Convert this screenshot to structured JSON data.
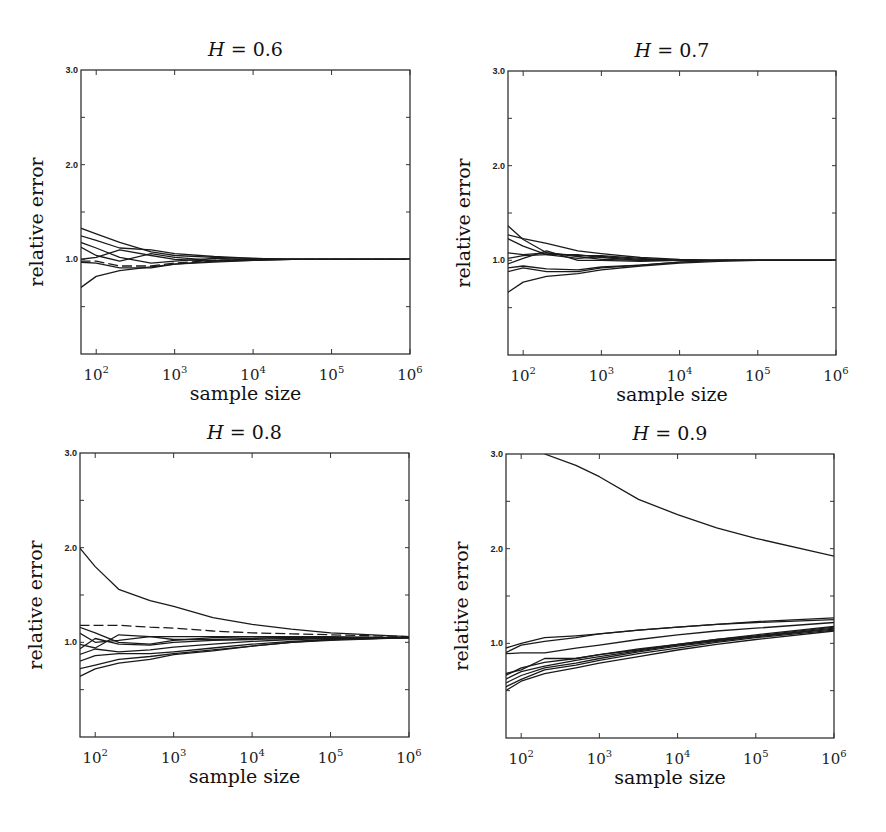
{
  "figure": {
    "x_label": "sample size",
    "y_label": "relative error",
    "y_tick_labels": [
      "3.0",
      "2.0",
      "1.0"
    ],
    "x_tick_labels": [
      {
        "base": "10",
        "exp": "2"
      },
      {
        "base": "10",
        "exp": "3"
      },
      {
        "base": "10",
        "exp": "4"
      },
      {
        "base": "10",
        "exp": "5"
      },
      {
        "base": "10",
        "exp": "6"
      }
    ],
    "line_color": "#1a1a1a"
  },
  "chart_data": [
    {
      "type": "line",
      "title": "H = 0.6",
      "title_var": "H",
      "title_value": "= 0.6",
      "xlabel": "sample size",
      "ylabel": "relative error",
      "xscale": "log",
      "xlim": [
        64,
        1000000
      ],
      "ylim": [
        0,
        3
      ],
      "yticks": [
        1.0,
        2.0,
        3.0
      ],
      "xticks": [
        100,
        1000,
        10000,
        100000,
        1000000
      ],
      "grid": false,
      "x_log10": [
        1.8,
        2.0,
        2.3,
        2.7,
        3.0,
        3.5,
        4.0,
        4.5,
        5.0,
        6.0
      ],
      "series": [
        {
          "name": "run 1",
          "values": [
            1.33,
            1.27,
            1.18,
            1.08,
            1.04,
            1.02,
            1.01,
            1.0,
            1.0,
            1.0
          ]
        },
        {
          "name": "run 2",
          "values": [
            1.25,
            1.2,
            1.12,
            1.1,
            1.06,
            1.03,
            1.01,
            1.0,
            1.0,
            1.0
          ]
        },
        {
          "name": "run 3",
          "values": [
            1.18,
            1.12,
            1.02,
            0.96,
            0.98,
            1.01,
            1.0,
            1.0,
            1.0,
            1.0
          ]
        },
        {
          "name": "run 4",
          "values": [
            1.13,
            1.04,
            0.98,
            1.06,
            1.02,
            0.99,
            1.0,
            1.0,
            1.0,
            1.0
          ]
        },
        {
          "name": "run 5",
          "values": [
            1.0,
            1.02,
            1.1,
            1.04,
            1.0,
            0.98,
            1.0,
            1.0,
            1.0,
            1.0
          ]
        },
        {
          "name": "run 6",
          "values": [
            0.98,
            0.98,
            0.93,
            0.93,
            0.96,
            0.99,
            1.0,
            1.0,
            1.0,
            1.0
          ],
          "dashed": true
        },
        {
          "name": "run 7",
          "values": [
            0.97,
            0.96,
            0.91,
            0.91,
            0.95,
            0.97,
            0.99,
            1.0,
            1.0,
            1.0
          ]
        },
        {
          "name": "run 8",
          "values": [
            0.7,
            0.82,
            0.88,
            0.92,
            0.95,
            0.98,
            0.99,
            1.0,
            1.0,
            1.0
          ]
        }
      ]
    },
    {
      "type": "line",
      "title": "H = 0.7",
      "title_var": "H",
      "title_value": "= 0.7",
      "xlabel": "sample size",
      "ylabel": "relative error",
      "xscale": "log",
      "xlim": [
        64,
        1000000
      ],
      "ylim": [
        0,
        3
      ],
      "yticks": [
        1.0,
        2.0,
        3.0
      ],
      "xticks": [
        100,
        1000,
        10000,
        100000,
        1000000
      ],
      "grid": false,
      "x_log10": [
        1.8,
        2.0,
        2.3,
        2.7,
        3.0,
        3.5,
        4.0,
        4.5,
        5.0,
        6.0
      ],
      "series": [
        {
          "name": "run 1",
          "values": [
            1.37,
            1.22,
            1.08,
            1.04,
            1.01,
            1.0,
            1.0,
            1.0,
            1.0,
            1.0
          ]
        },
        {
          "name": "run 2",
          "values": [
            1.27,
            1.23,
            1.18,
            1.1,
            1.07,
            1.03,
            1.01,
            1.0,
            1.0,
            1.0
          ]
        },
        {
          "name": "run 3",
          "values": [
            1.23,
            1.15,
            1.06,
            1.02,
            1.04,
            1.01,
            1.0,
            1.0,
            1.0,
            1.0
          ]
        },
        {
          "name": "run 4",
          "values": [
            1.08,
            1.06,
            1.08,
            1.05,
            1.05,
            1.02,
            1.0,
            1.0,
            1.0,
            1.0
          ]
        },
        {
          "name": "run 5",
          "values": [
            1.02,
            1.05,
            1.06,
            1.06,
            1.03,
            1.0,
            1.0,
            1.0,
            1.0,
            1.0
          ]
        },
        {
          "name": "run 6",
          "values": [
            0.96,
            1.02,
            1.1,
            1.0,
            1.0,
            0.99,
            1.0,
            1.0,
            1.0,
            1.0
          ]
        },
        {
          "name": "run 7",
          "values": [
            0.92,
            0.94,
            0.91,
            0.9,
            0.93,
            0.95,
            0.98,
            1.0,
            1.0,
            1.0
          ]
        },
        {
          "name": "run 8",
          "values": [
            0.88,
            0.92,
            0.88,
            0.88,
            0.92,
            0.95,
            0.98,
            1.0,
            1.0,
            1.0
          ]
        },
        {
          "name": "run 9",
          "values": [
            0.66,
            0.77,
            0.83,
            0.86,
            0.9,
            0.94,
            0.97,
            0.99,
            1.0,
            1.0
          ]
        }
      ]
    },
    {
      "type": "line",
      "title": "H = 0.8",
      "title_var": "H",
      "title_value": "= 0.8",
      "xlabel": "sample size",
      "ylabel": "relative error",
      "xscale": "log",
      "xlim": [
        64,
        1000000
      ],
      "ylim": [
        0,
        3
      ],
      "yticks": [
        1.0,
        2.0,
        3.0
      ],
      "xticks": [
        100,
        1000,
        10000,
        100000,
        1000000
      ],
      "grid": false,
      "x_log10": [
        1.8,
        2.0,
        2.3,
        2.7,
        3.0,
        3.5,
        4.0,
        4.5,
        5.0,
        6.0
      ],
      "series": [
        {
          "name": "run 1",
          "values": [
            2.0,
            1.8,
            1.56,
            1.44,
            1.38,
            1.26,
            1.19,
            1.14,
            1.1,
            1.06
          ]
        },
        {
          "name": "run 2",
          "values": [
            1.18,
            1.18,
            1.18,
            1.16,
            1.15,
            1.12,
            1.1,
            1.09,
            1.08,
            1.06
          ],
          "dashed": true
        },
        {
          "name": "run 3",
          "values": [
            1.16,
            1.1,
            1.0,
            0.98,
            1.02,
            1.05,
            1.06,
            1.06,
            1.06,
            1.05
          ]
        },
        {
          "name": "run 4",
          "values": [
            1.1,
            1.0,
            1.02,
            1.06,
            1.06,
            1.06,
            1.06,
            1.05,
            1.05,
            1.05
          ]
        },
        {
          "name": "run 5",
          "values": [
            0.98,
            0.94,
            1.08,
            1.06,
            1.03,
            1.03,
            1.04,
            1.05,
            1.05,
            1.05
          ]
        },
        {
          "name": "run 6",
          "values": [
            0.93,
            1.04,
            0.98,
            0.97,
            1.0,
            1.02,
            1.03,
            1.04,
            1.05,
            1.05
          ]
        },
        {
          "name": "run 7",
          "values": [
            0.87,
            0.93,
            0.9,
            0.92,
            0.95,
            0.98,
            1.01,
            1.03,
            1.04,
            1.05
          ]
        },
        {
          "name": "run 8",
          "values": [
            0.8,
            0.86,
            0.88,
            0.88,
            0.9,
            0.94,
            0.98,
            1.01,
            1.03,
            1.05
          ]
        },
        {
          "name": "run 9",
          "values": [
            0.72,
            0.76,
            0.82,
            0.85,
            0.88,
            0.92,
            0.96,
            1.0,
            1.03,
            1.05
          ]
        },
        {
          "name": "run 10",
          "values": [
            0.64,
            0.72,
            0.78,
            0.82,
            0.87,
            0.91,
            0.96,
            1.0,
            1.02,
            1.05
          ]
        }
      ]
    },
    {
      "type": "line",
      "title": "H = 0.9",
      "title_var": "H",
      "title_value": "= 0.9",
      "xlabel": "sample size",
      "ylabel": "relative error",
      "xscale": "log",
      "xlim": [
        64,
        1000000
      ],
      "ylim": [
        0,
        3
      ],
      "yticks": [
        1.0,
        2.0,
        3.0
      ],
      "xticks": [
        100,
        1000,
        10000,
        100000,
        1000000
      ],
      "grid": false,
      "x_log10": [
        1.8,
        2.0,
        2.3,
        2.7,
        3.0,
        3.5,
        4.0,
        4.5,
        5.0,
        6.0
      ],
      "series": [
        {
          "name": "run 1",
          "values": [
            null,
            null,
            3.0,
            2.88,
            2.76,
            2.52,
            2.36,
            2.22,
            2.11,
            1.92
          ]
        },
        {
          "name": "run 2",
          "values": [
            0.95,
            1.0,
            1.06,
            1.08,
            1.1,
            1.14,
            1.17,
            1.2,
            1.23,
            1.27
          ]
        },
        {
          "name": "run 3",
          "values": [
            0.9,
            0.98,
            1.02,
            1.06,
            1.1,
            1.14,
            1.17,
            1.2,
            1.22,
            1.25
          ]
        },
        {
          "name": "run 4",
          "values": [
            0.89,
            0.9,
            0.9,
            0.95,
            0.98,
            1.04,
            1.09,
            1.13,
            1.16,
            1.22
          ]
        },
        {
          "name": "run 5",
          "values": [
            0.68,
            0.72,
            0.84,
            0.84,
            0.88,
            0.93,
            0.99,
            1.04,
            1.09,
            1.18
          ]
        },
        {
          "name": "run 6",
          "values": [
            0.66,
            0.74,
            0.8,
            0.84,
            0.88,
            0.94,
            0.99,
            1.04,
            1.08,
            1.17
          ]
        },
        {
          "name": "run 7",
          "values": [
            0.62,
            0.7,
            0.76,
            0.82,
            0.86,
            0.92,
            0.98,
            1.03,
            1.07,
            1.16
          ]
        },
        {
          "name": "run 8",
          "values": [
            0.58,
            0.66,
            0.74,
            0.79,
            0.84,
            0.91,
            0.97,
            1.02,
            1.07,
            1.15
          ]
        },
        {
          "name": "run 9",
          "values": [
            0.54,
            0.62,
            0.72,
            0.77,
            0.82,
            0.89,
            0.95,
            1.01,
            1.06,
            1.14
          ]
        },
        {
          "name": "run 10",
          "values": [
            0.5,
            0.6,
            0.68,
            0.74,
            0.79,
            0.86,
            0.93,
            0.99,
            1.04,
            1.13
          ]
        }
      ]
    }
  ]
}
